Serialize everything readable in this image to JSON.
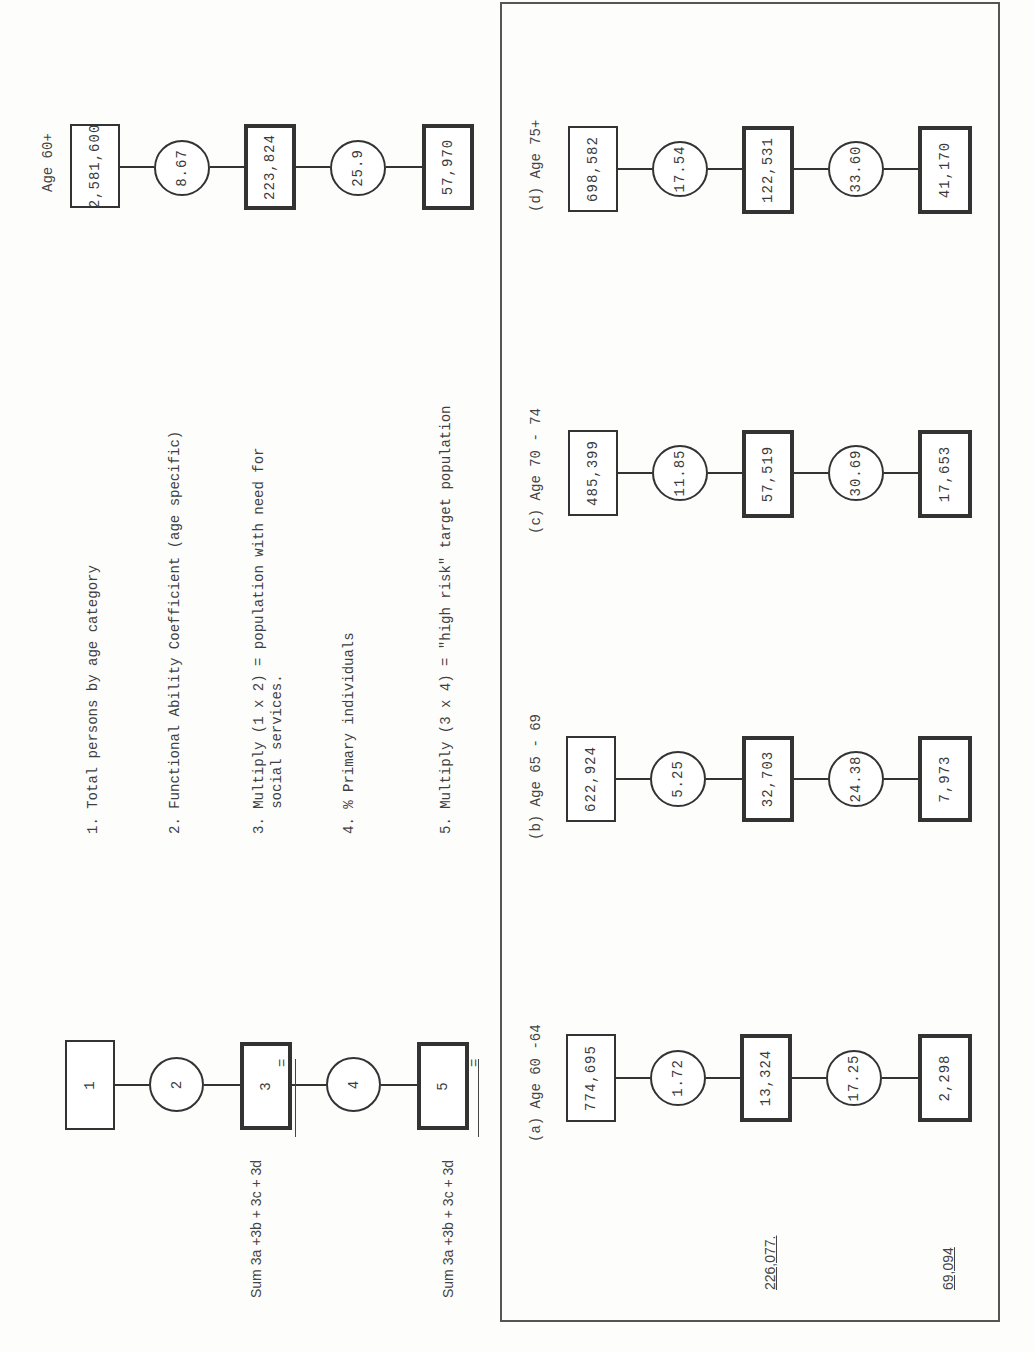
{
  "key_diagram": {
    "steps": [
      "1",
      "2",
      "3",
      "4",
      "5"
    ]
  },
  "legend": {
    "items": [
      "1. Total persons by age category",
      "2. Functional Ability Coefficient (age specific)",
      "3. Multiply (1 x 2) = population with need for\n   social services.",
      "4. % Primary individuals",
      "5. Multiply (3 x 4) = \"high risk\" target population"
    ]
  },
  "sum_formulas": {
    "line1": "Sum 3a +3b + 3c + 3d",
    "line1_eq": "=",
    "line2": "Sum 3a +3b + 3c + 3d",
    "line2_eq": "="
  },
  "overall": {
    "label": "Age 60+",
    "total_persons": "2,581,600",
    "coefficient": "8.67",
    "need_population": "223,824",
    "pct_primary": "25.9",
    "high_risk": "57,970"
  },
  "groups": [
    {
      "label": "(a) Age 60 -64",
      "total_persons": "774,695",
      "coefficient": "1.72",
      "need_population": "13,324",
      "pct_primary": "17.25",
      "high_risk": "2,298"
    },
    {
      "label": "(b) Age 65 - 69",
      "total_persons": "622,924",
      "coefficient": "5.25",
      "need_population": "32,703",
      "pct_primary": "24.38",
      "high_risk": "7,973"
    },
    {
      "label": "(c) Age 70 - 74",
      "total_persons": "485,399",
      "coefficient": "11.85",
      "need_population": "57,519",
      "pct_primary": "30.69",
      "high_risk": "17,653"
    },
    {
      "label": "(d) Age 75+",
      "total_persons": "698,582",
      "coefficient": "17.54",
      "need_population": "122,531",
      "pct_primary": "33.60",
      "high_risk": "41,170"
    }
  ],
  "totals": {
    "sum_need": "226,077.",
    "sum_high_risk": "69,094"
  }
}
